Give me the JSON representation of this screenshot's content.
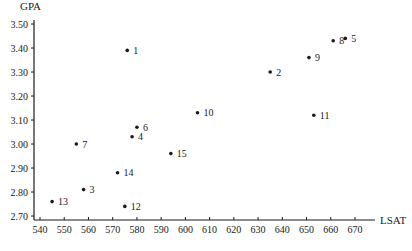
{
  "chart_data": {
    "type": "scatter",
    "title": "",
    "xlabel": "LSAT",
    "ylabel": "GPA",
    "xlim": [
      540,
      670
    ],
    "ylim": [
      2.7,
      3.5
    ],
    "grid": false,
    "legend": null,
    "x_ticks": [
      "540",
      "550",
      "560",
      "570",
      "580",
      "590",
      "600",
      "610",
      "620",
      "630",
      "640",
      "650",
      "660",
      "670"
    ],
    "y_ticks": [
      "2.70",
      "2.80",
      "2.90",
      "3.00",
      "3.10",
      "3.20",
      "3.30",
      "3.40",
      "3.50"
    ],
    "points": [
      {
        "label": "1",
        "x": 576,
        "y": 3.39
      },
      {
        "label": "2",
        "x": 635,
        "y": 3.3
      },
      {
        "label": "3",
        "x": 558,
        "y": 2.81
      },
      {
        "label": "4",
        "x": 578,
        "y": 3.03
      },
      {
        "label": "5",
        "x": 666,
        "y": 3.44
      },
      {
        "label": "6",
        "x": 580,
        "y": 3.07
      },
      {
        "label": "7",
        "x": 555,
        "y": 3.0
      },
      {
        "label": "8",
        "x": 661,
        "y": 3.43
      },
      {
        "label": "9",
        "x": 651,
        "y": 3.36
      },
      {
        "label": "10",
        "x": 605,
        "y": 3.13
      },
      {
        "label": "11",
        "x": 653,
        "y": 3.12
      },
      {
        "label": "12",
        "x": 575,
        "y": 2.74
      },
      {
        "label": "13",
        "x": 545,
        "y": 2.76
      },
      {
        "label": "14",
        "x": 572,
        "y": 2.88
      },
      {
        "label": "15",
        "x": 594,
        "y": 2.96
      }
    ]
  },
  "colors": {
    "ink": "#1a1a1a",
    "background": "#ffffff"
  }
}
